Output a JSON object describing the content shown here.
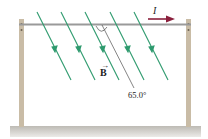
{
  "figure": {
    "current_label": "I",
    "field_label": "B",
    "field_vector_mark": "→",
    "angle_label": "65.0°",
    "angle_degrees": 65.0
  },
  "colors": {
    "field_lines": "#2e9a6e",
    "wire": "#9a9a9a",
    "posts": "#c9bca6",
    "current_arrow": "#8a1f3c",
    "ground": "#cfcdc8",
    "reference_line": "#333333"
  },
  "field_lines": [
    {
      "x1": 37,
      "y1": 12,
      "x2": 71,
      "y2": 80
    },
    {
      "x1": 61,
      "y1": 12,
      "x2": 95,
      "y2": 80
    },
    {
      "x1": 85,
      "y1": 12,
      "x2": 119,
      "y2": 80
    },
    {
      "x1": 110,
      "y1": 12,
      "x2": 144,
      "y2": 80
    },
    {
      "x1": 134,
      "y1": 12,
      "x2": 168,
      "y2": 80
    }
  ]
}
